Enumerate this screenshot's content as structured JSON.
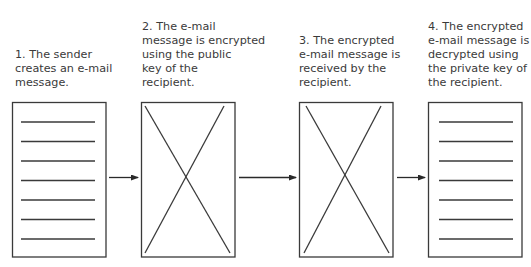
{
  "steps": [
    {
      "number": 1,
      "caption_lines": [
        "1. The sender",
        "creates an e-mail",
        "message."
      ],
      "document_state": "plaintext"
    },
    {
      "number": 2,
      "caption_lines": [
        "2. The e-mail",
        "message is encrypted",
        "using the public",
        "key of the",
        "recipient."
      ],
      "document_state": "encrypted"
    },
    {
      "number": 3,
      "caption_lines": [
        "3. The encrypted",
        "e-mail message is",
        "received by the",
        "recipient."
      ],
      "document_state": "encrypted"
    },
    {
      "number": 4,
      "caption_lines": [
        "4. The encrypted",
        "e-mail message is",
        "decrypted using",
        "the private key of",
        "the recipient."
      ],
      "document_state": "plaintext"
    }
  ],
  "colors": {
    "stroke": "#3a3a3a",
    "text": "#3a3a3a",
    "background": "#ffffff"
  }
}
